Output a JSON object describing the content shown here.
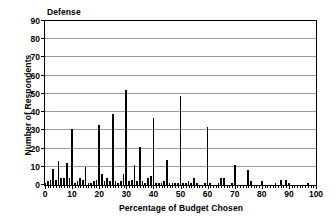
{
  "chart_data": {
    "type": "bar",
    "title": "Defense",
    "xlabel": "Percentage of Budget Chosen",
    "ylabel": "Number of Respondents",
    "xlim": [
      0,
      100
    ],
    "ylim": [
      0,
      90
    ],
    "grid": true,
    "legend": null,
    "xticks": [
      0,
      10,
      20,
      30,
      40,
      50,
      60,
      70,
      80,
      90,
      100
    ],
    "xtick_labels": [
      "0",
      "10",
      "20",
      "30",
      "40",
      "50",
      "60",
      "70",
      "80",
      "90",
      "100"
    ],
    "xtick_minor_step": 1,
    "yticks": [
      0,
      10,
      20,
      30,
      40,
      50,
      60,
      70,
      80,
      90
    ],
    "ytick_labels": [
      "0",
      "10",
      "20",
      "30",
      "40",
      "50",
      "60",
      "70",
      "80",
      "90"
    ],
    "bar_color": "#000000",
    "x": [
      0,
      1,
      2,
      3,
      4,
      5,
      6,
      7,
      8,
      9,
      10,
      11,
      12,
      13,
      14,
      15,
      16,
      17,
      18,
      19,
      20,
      21,
      22,
      23,
      24,
      25,
      26,
      27,
      28,
      29,
      30,
      31,
      32,
      33,
      34,
      35,
      36,
      37,
      38,
      39,
      40,
      41,
      42,
      43,
      44,
      45,
      46,
      47,
      48,
      49,
      50,
      51,
      52,
      53,
      54,
      55,
      56,
      57,
      58,
      59,
      60,
      61,
      62,
      63,
      64,
      65,
      66,
      67,
      68,
      69,
      70,
      71,
      72,
      73,
      74,
      75,
      76,
      77,
      78,
      79,
      80,
      81,
      82,
      83,
      84,
      85,
      86,
      87,
      88,
      89,
      90,
      91,
      92,
      93,
      94,
      95,
      96,
      97,
      98,
      99,
      100
    ],
    "values": [
      1,
      2,
      3,
      9,
      3,
      13,
      4,
      4,
      12,
      4,
      31,
      1,
      2,
      4,
      3,
      10,
      1,
      1,
      2,
      3,
      33,
      6,
      2,
      4,
      2,
      39,
      2,
      1,
      2,
      6,
      52,
      2,
      3,
      11,
      2,
      21,
      2,
      1,
      4,
      5,
      37,
      1,
      1,
      1,
      2,
      14,
      1,
      1,
      1,
      1,
      49,
      1,
      1,
      2,
      1,
      4,
      1,
      0,
      0,
      1,
      32,
      1,
      0,
      0,
      1,
      4,
      4,
      0,
      0,
      1,
      11,
      0,
      0,
      0,
      0,
      8,
      2,
      0,
      0,
      0,
      2,
      0,
      0,
      0,
      0,
      1,
      0,
      3,
      0,
      3,
      1,
      0,
      0,
      0,
      0,
      0,
      0,
      1,
      0,
      0,
      0
    ]
  }
}
